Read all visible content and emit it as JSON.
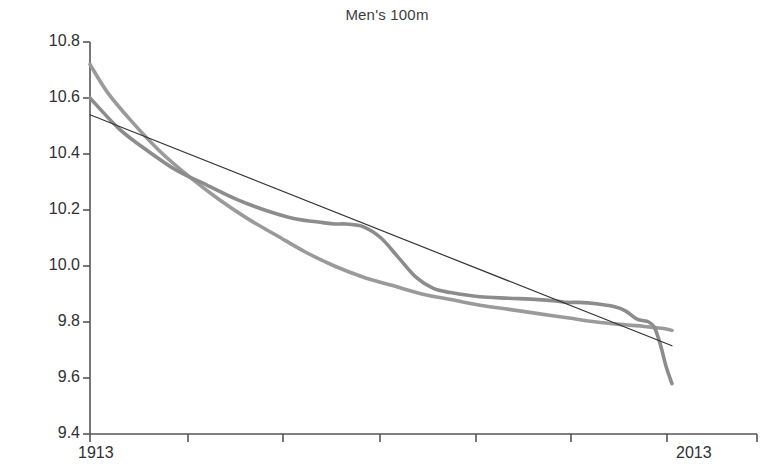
{
  "chart_data": {
    "type": "line",
    "title": "Men's 100m",
    "xlabel": "",
    "ylabel": "Time",
    "xlim": [
      1913,
      2013
    ],
    "ylim": [
      9.4,
      10.8
    ],
    "grid": false,
    "legend": null,
    "x_tick_labels": [
      "1913",
      "2013"
    ],
    "y_tick_labels": [
      "10.8",
      "10.6",
      "10.4",
      "10.2",
      "10.0",
      "9.8",
      "9.6",
      "9.4"
    ],
    "y_tick_values": [
      10.8,
      10.6,
      10.4,
      10.2,
      10.0,
      9.8,
      9.6,
      9.4
    ],
    "x_tick_values": [
      1913,
      1928,
      1943,
      1958,
      1973,
      1988,
      2003,
      2013
    ],
    "series": [
      {
        "name": "smooth-fit-light",
        "color": "#9a9a9a",
        "width": 3.6,
        "x": [
          1913,
          1916,
          1920,
          1925,
          1930,
          1935,
          1940,
          1945,
          1950,
          1955,
          1960,
          1965,
          1970,
          1975,
          1980,
          1985,
          1990,
          1995,
          2000,
          2005,
          2008,
          2010,
          2012,
          2013
        ],
        "y": [
          10.72,
          10.62,
          10.52,
          10.41,
          10.32,
          10.24,
          10.17,
          10.11,
          10.05,
          10.0,
          9.96,
          9.93,
          9.9,
          9.88,
          9.86,
          9.845,
          9.83,
          9.815,
          9.8,
          9.79,
          9.785,
          9.78,
          9.775,
          9.77
        ]
      },
      {
        "name": "smooth-fit-dark",
        "color": "#8c8c8c",
        "width": 3.6,
        "x": [
          1913,
          1918,
          1923,
          1928,
          1933,
          1938,
          1943,
          1948,
          1953,
          1955,
          1957,
          1960,
          1963,
          1966,
          1969,
          1972,
          1975,
          1980,
          1985,
          1990,
          1993,
          1995,
          1997,
          2000,
          2003,
          2005,
          2007,
          2009,
          2010,
          2011,
          2012,
          2013
        ],
        "y": [
          10.6,
          10.49,
          10.41,
          10.34,
          10.29,
          10.24,
          10.2,
          10.17,
          10.155,
          10.15,
          10.15,
          10.14,
          10.1,
          10.03,
          9.96,
          9.92,
          9.905,
          9.89,
          9.885,
          9.88,
          9.875,
          9.87,
          9.87,
          9.865,
          9.855,
          9.84,
          9.81,
          9.8,
          9.78,
          9.72,
          9.64,
          9.58
        ]
      },
      {
        "name": "linear-trend",
        "color": "#343434",
        "width": 1.2,
        "x": [
          1913,
          2013
        ],
        "y": [
          10.54,
          9.715
        ]
      }
    ]
  },
  "axes": {
    "y_axis_label": "Time",
    "x_axis_label": ""
  }
}
